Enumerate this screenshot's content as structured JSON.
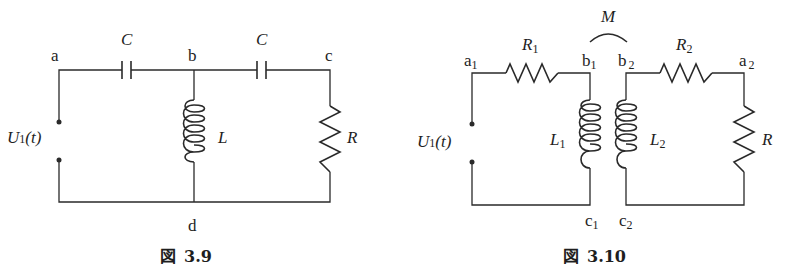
{
  "figures": [
    {
      "caption": "図 3.9",
      "caption_prefix": "図",
      "caption_number": "3.9",
      "nodes": {
        "a": "a",
        "b": "b",
        "c": "c",
        "d": "d"
      },
      "components": {
        "capacitor_1": "C",
        "capacitor_2": "C",
        "inductor": "L",
        "resistor": "R"
      },
      "source": {
        "symbol": "U",
        "subscript": "1",
        "arg": "(t)"
      }
    },
    {
      "caption": "図 3.10",
      "caption_prefix": "図",
      "caption_number": "3.10",
      "nodes": {
        "a1": {
          "base": "a",
          "sub": "1"
        },
        "b1": {
          "base": "b",
          "sub": "1"
        },
        "c1": {
          "base": "c",
          "sub": "1"
        },
        "a2": {
          "base": "a",
          "sub": "2"
        },
        "b2": {
          "base": "b",
          "sub": "2"
        },
        "c2": {
          "base": "c",
          "sub": "2"
        }
      },
      "components": {
        "resistor_1": {
          "base": "R",
          "sub": "1"
        },
        "resistor_2": {
          "base": "R",
          "sub": "2"
        },
        "inductor_1": {
          "base": "L",
          "sub": "1"
        },
        "inductor_2": {
          "base": "L",
          "sub": "2"
        },
        "load_resistor": "R",
        "mutual_inductance": "M"
      },
      "source": {
        "symbol": "U",
        "subscript": "1",
        "arg": "(t)"
      }
    }
  ]
}
